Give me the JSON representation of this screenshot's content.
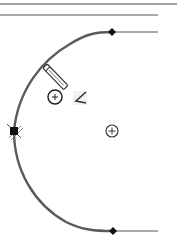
{
  "canvas": {
    "width": 177,
    "height": 238,
    "background": "#ffffff"
  },
  "colors": {
    "line": "#444444",
    "arc": "#5a5a5a",
    "endpoint": "#111111",
    "marker": "#222222",
    "cursor": "#333333"
  },
  "geometry": {
    "top_edge": {
      "x1": 0,
      "y1": 4,
      "x2": 177,
      "y2": 4
    },
    "second_line": {
      "x1": 0,
      "y1": 15,
      "x2": 158,
      "y2": 15
    },
    "upper_tangent_line": {
      "x1": 112,
      "y1": 32,
      "x2": 158,
      "y2": 32
    },
    "lower_tangent_line": {
      "x1": 112,
      "y1": 231,
      "x2": 158,
      "y2": 231
    },
    "arc": {
      "start": [
        112,
        32
      ],
      "end": [
        112,
        231
      ],
      "radius": 99.5,
      "center": [
        113,
        131
      ]
    },
    "arc_midpoint": [
      14,
      131
    ],
    "center_marker": [
      112,
      131
    ],
    "cursor_marker": [
      55,
      97
    ],
    "pencil_tool": {
      "tip": [
        68,
        90
      ],
      "tail": [
        45,
        66
      ]
    },
    "angle_icon": [
      80,
      99
    ]
  },
  "icons": {
    "endpoint_top": "diamond-endpoint-icon",
    "endpoint_bottom": "diamond-endpoint-icon",
    "midpoint": "square-midpoint-icon",
    "center": "circle-plus-center-icon",
    "cursor": "circle-plus-cursor-icon",
    "pencil": "pencil-icon",
    "angle": "angle-constraint-icon"
  }
}
